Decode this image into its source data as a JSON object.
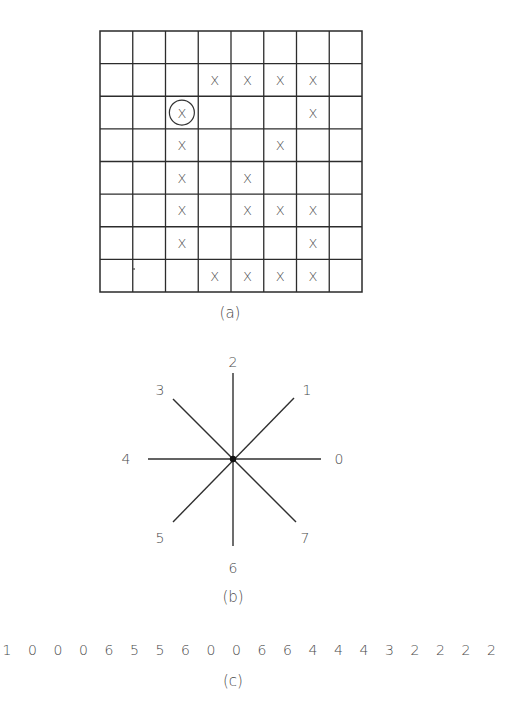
{
  "figure": {
    "panel_a": {
      "caption": "(a)",
      "grid": {
        "rows": 8,
        "cols": 8,
        "left": 100,
        "top": 31,
        "right": 362,
        "bottom": 292
      },
      "mark_glyph": "X",
      "marks": [
        {
          "row": 1,
          "col": 3
        },
        {
          "row": 1,
          "col": 4
        },
        {
          "row": 1,
          "col": 5
        },
        {
          "row": 1,
          "col": 6
        },
        {
          "row": 2,
          "col": 2,
          "circled": true
        },
        {
          "row": 2,
          "col": 6
        },
        {
          "row": 3,
          "col": 2
        },
        {
          "row": 3,
          "col": 5
        },
        {
          "row": 4,
          "col": 2
        },
        {
          "row": 4,
          "col": 4
        },
        {
          "row": 5,
          "col": 2
        },
        {
          "row": 5,
          "col": 4
        },
        {
          "row": 5,
          "col": 5
        },
        {
          "row": 5,
          "col": 6
        },
        {
          "row": 6,
          "col": 2
        },
        {
          "row": 6,
          "col": 6
        },
        {
          "row": 7,
          "col": 3
        },
        {
          "row": 7,
          "col": 4
        },
        {
          "row": 7,
          "col": 5
        },
        {
          "row": 7,
          "col": 6
        }
      ],
      "start_cell": {
        "row": 2,
        "col": 2,
        "note": "circled start pixel"
      }
    },
    "panel_b": {
      "caption": "(b)",
      "center": {
        "x": 233,
        "y": 459
      },
      "directions": [
        {
          "code": "0",
          "label": "0",
          "angle_deg": 0
        },
        {
          "code": "1",
          "label": "1",
          "angle_deg": 45
        },
        {
          "code": "2",
          "label": "2",
          "angle_deg": 90
        },
        {
          "code": "3",
          "label": "3",
          "angle_deg": 135
        },
        {
          "code": "4",
          "label": "4",
          "angle_deg": 180
        },
        {
          "code": "5",
          "label": "5",
          "angle_deg": 225
        },
        {
          "code": "6",
          "label": "6",
          "angle_deg": 270
        },
        {
          "code": "7",
          "label": "7",
          "angle_deg": 315
        }
      ]
    },
    "panel_c": {
      "caption": "(c)",
      "chain_code": [
        "1",
        "0",
        "0",
        "0",
        "6",
        "5",
        "5",
        "6",
        "0",
        "0",
        "6",
        "6",
        "4",
        "4",
        "4",
        "3",
        "2",
        "2",
        "2",
        "2"
      ]
    }
  }
}
